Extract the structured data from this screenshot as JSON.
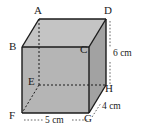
{
  "figure": {
    "type": "cuboid-net-diagram",
    "shape_name": "cuboid",
    "background_color": "#ffffff",
    "line_color": "#1b1b1b",
    "face_colors": {
      "front": "#b5b5b5",
      "top": "#c4c4c4",
      "right": "#a2a2a2"
    },
    "vertices": [
      {
        "id": "A",
        "label": "A",
        "position": "back-top-left",
        "hidden": false,
        "x": 39,
        "y": 19
      },
      {
        "id": "B",
        "label": "B",
        "position": "front-top-left",
        "hidden": false,
        "x": 22,
        "y": 47
      },
      {
        "id": "C",
        "label": "C",
        "position": "front-top-right",
        "hidden": false,
        "x": 89,
        "y": 47
      },
      {
        "id": "D",
        "label": "D",
        "position": "back-top-right",
        "hidden": false,
        "x": 106,
        "y": 19
      },
      {
        "id": "E",
        "label": "E",
        "position": "back-bottom-left",
        "hidden": true,
        "x": 39,
        "y": 85
      },
      {
        "id": "F",
        "label": "F",
        "position": "front-bottom-left",
        "hidden": false,
        "x": 22,
        "y": 113
      },
      {
        "id": "G",
        "label": "G",
        "position": "front-bottom-right",
        "hidden": false,
        "x": 89,
        "y": 113
      },
      {
        "id": "H",
        "label": "H",
        "position": "back-bottom-right",
        "hidden": false,
        "x": 106,
        "y": 85
      }
    ],
    "dimensions": [
      {
        "id": "width",
        "label": "5 cm",
        "value": 5,
        "unit": "cm",
        "edge": "FG",
        "orientation": "horizontal",
        "placement": "bottom"
      },
      {
        "id": "depth",
        "label": "4 cm",
        "value": 4,
        "unit": "cm",
        "edge": "GH",
        "orientation": "diagonal",
        "placement": "bottom-right"
      },
      {
        "id": "height",
        "label": "6 cm",
        "value": 6,
        "unit": "cm",
        "edge": "DH",
        "orientation": "vertical",
        "placement": "right"
      }
    ],
    "vertex_labels": {
      "A": "A",
      "B": "B",
      "C": "C",
      "D": "D",
      "E": "E",
      "F": "F",
      "G": "G",
      "H": "H"
    },
    "dimension_labels": {
      "width": "5 cm",
      "depth": "4 cm",
      "height": "6 cm"
    }
  }
}
